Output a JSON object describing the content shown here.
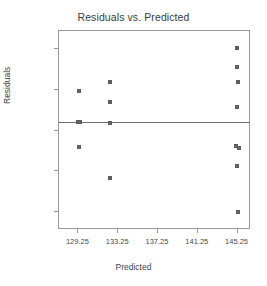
{
  "chart_data": {
    "type": "scatter",
    "title": "Residuals vs. Predicted",
    "xlabel": "Predicted",
    "ylabel": "Residuals",
    "xlim": [
      127.3,
      146.6
    ],
    "ylim": [
      -9.9,
      8.4
    ],
    "xticks": [
      129.25,
      133.25,
      137.25,
      141.25,
      145.25
    ],
    "xtick_labels": [
      "129.25",
      "133.25",
      "137.25",
      "141.25",
      "145.25"
    ],
    "yticks": [
      6.75,
      3,
      -0.75,
      -4.5,
      -8.25
    ],
    "ytick_labels": [
      "6.75",
      "3",
      "-0.75",
      "-4.5",
      "-8.25"
    ],
    "grid": false,
    "legend": null,
    "reference_line": {
      "orientation": "horizontal",
      "y": 0.0
    },
    "marker": {
      "shape": "square",
      "color": "#6b6b6b",
      "size": 4
    },
    "points": [
      {
        "x": 129.3,
        "y": 2.85
      },
      {
        "x": 129.2,
        "y": 0.0
      },
      {
        "x": 129.4,
        "y": 0.0
      },
      {
        "x": 129.3,
        "y": -2.3
      },
      {
        "x": 132.4,
        "y": 3.75
      },
      {
        "x": 132.4,
        "y": 1.85
      },
      {
        "x": 132.4,
        "y": -0.1
      },
      {
        "x": 132.4,
        "y": -5.1
      },
      {
        "x": 145.2,
        "y": 6.85
      },
      {
        "x": 145.2,
        "y": 5.05
      },
      {
        "x": 145.3,
        "y": 3.75
      },
      {
        "x": 145.2,
        "y": 1.4
      },
      {
        "x": 145.1,
        "y": -2.15
      },
      {
        "x": 145.35,
        "y": -2.35
      },
      {
        "x": 145.2,
        "y": -4.05
      },
      {
        "x": 145.25,
        "y": -8.2
      }
    ]
  },
  "colors": {
    "frame": "#9a9a9a",
    "marker": "#6b6b6b",
    "reference_line": "#6e6e6e",
    "text": "#3f3f3f",
    "background": "#ffffff"
  }
}
